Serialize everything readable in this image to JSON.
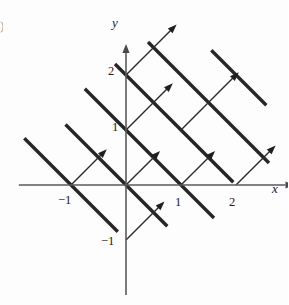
{
  "figure": {
    "corner_mark": ")",
    "axes": {
      "x_label": "x",
      "y_label": "y",
      "x_axis_name": "x-axis",
      "y_axis_name": "y-axis",
      "origin_px": [
        126,
        185
      ],
      "unit_px": 55,
      "x_range": [
        -1.95,
        2.9
      ],
      "y_range": [
        -2.0,
        2.4
      ]
    },
    "tick_labels": [
      {
        "text": "2",
        "axis": "y",
        "value": 2,
        "left": 108,
        "top": 65
      },
      {
        "text": "1",
        "axis": "y",
        "value": 1,
        "left": 112,
        "top": 121
      },
      {
        "text": "−1",
        "axis": "y",
        "value": -1,
        "left": 101,
        "top": 235
      },
      {
        "text": "−1",
        "axis": "x",
        "value": -1,
        "left": 58,
        "top": 194
      },
      {
        "text": "1",
        "axis": "x",
        "value": 1,
        "left": 175,
        "top": 196
      },
      {
        "text": "2",
        "axis": "x",
        "value": 2,
        "left": 229,
        "top": 196
      }
    ],
    "colors": {
      "level_line": "#262626",
      "gradient_arrow": "#2c2c2c",
      "axis": "#5a5a5a",
      "background": "#fdfdfd",
      "text": "#1a1a1a"
    }
  },
  "chart_data": {
    "type": "line",
    "subtitle": "",
    "xlabel": "x",
    "ylabel": "y",
    "xlim": [
      -1.95,
      2.9
    ],
    "ylim": [
      -2.0,
      2.4
    ],
    "grid": false,
    "legend": "none",
    "level_curves": {
      "equation": "x + y = c",
      "slope": -1,
      "c_values": [
        -1,
        0,
        1,
        2,
        3,
        4
      ],
      "segments": [
        {
          "c": -1,
          "x1": -1.85,
          "y1": 0.85,
          "x2": -0.15,
          "y2": -0.85
        },
        {
          "c": 0,
          "x1": -1.1,
          "y1": 1.1,
          "x2": 0.75,
          "y2": -0.75
        },
        {
          "c": 1,
          "x1": -0.75,
          "y1": 1.75,
          "x2": 1.6,
          "y2": -0.6
        },
        {
          "c": 2,
          "x1": -0.2,
          "y1": 2.2,
          "x2": 1.95,
          "y2": 0.05
        },
        {
          "c": 3,
          "x1": 0.4,
          "y1": 2.6,
          "x2": 2.6,
          "y2": 0.4
        },
        {
          "c": 4,
          "x1": 1.55,
          "y1": 2.45,
          "x2": 2.55,
          "y2": 1.45
        }
      ]
    },
    "gradient_vectors": {
      "direction": [
        1,
        1
      ],
      "slope": 1,
      "description": "Unit-length arrows normal to each level line, pointing in the direction of increasing f.",
      "arrows": [
        {
          "x1": -1.0,
          "y1": 0.0,
          "x2": -0.35,
          "y2": 0.65
        },
        {
          "x1": 0.0,
          "y1": 0.0,
          "x2": 0.62,
          "y2": 0.62
        },
        {
          "x1": 0.0,
          "y1": 1.0,
          "x2": 0.85,
          "y2": 1.85
        },
        {
          "x1": 1.0,
          "y1": 0.0,
          "x2": 1.62,
          "y2": 0.62
        },
        {
          "x1": 0.0,
          "y1": -1.0,
          "x2": 0.7,
          "y2": -0.3
        },
        {
          "x1": 0.0,
          "y1": 2.0,
          "x2": 0.92,
          "y2": 2.92
        },
        {
          "x1": 2.0,
          "y1": 0.0,
          "x2": 2.72,
          "y2": 0.72
        },
        {
          "x1": 1.0,
          "y1": 1.0,
          "x2": 2.05,
          "y2": 2.05
        }
      ]
    }
  }
}
